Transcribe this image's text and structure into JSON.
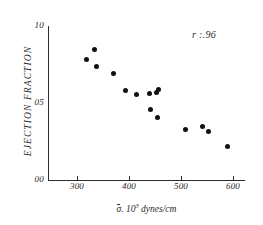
{
  "chart_data": {
    "type": "scatter",
    "title": "",
    "xlabel": "σ. 10³ dynes/cm",
    "ylabel": "EJECTION FRACTION",
    "annotation": "r :.96",
    "grid": false,
    "legend": false,
    "xlim": [
      250,
      620
    ],
    "ylim": [
      0.0,
      1.0
    ],
    "xticks": [
      300,
      400,
      500,
      600
    ],
    "xtick_labels": [
      "300",
      "400",
      "500",
      "600"
    ],
    "yticks": [
      0.0,
      0.5,
      1.0
    ],
    "ytick_labels": [
      "00",
      "05",
      "10"
    ],
    "points": [
      {
        "x": 318,
        "y": 0.78
      },
      {
        "x": 334,
        "y": 0.85
      },
      {
        "x": 337,
        "y": 0.74
      },
      {
        "x": 371,
        "y": 0.69
      },
      {
        "x": 394,
        "y": 0.58
      },
      {
        "x": 414,
        "y": 0.555
      },
      {
        "x": 440,
        "y": 0.56
      },
      {
        "x": 452,
        "y": 0.57
      },
      {
        "x": 457,
        "y": 0.59
      },
      {
        "x": 441,
        "y": 0.455
      },
      {
        "x": 455,
        "y": 0.405
      },
      {
        "x": 508,
        "y": 0.325
      },
      {
        "x": 542,
        "y": 0.345
      },
      {
        "x": 553,
        "y": 0.315
      },
      {
        "x": 590,
        "y": 0.215
      }
    ]
  },
  "axis_title_parts": {
    "sigma": "σ",
    "separator": ". 10",
    "exponent": "3",
    "units": " dynes/cm"
  }
}
